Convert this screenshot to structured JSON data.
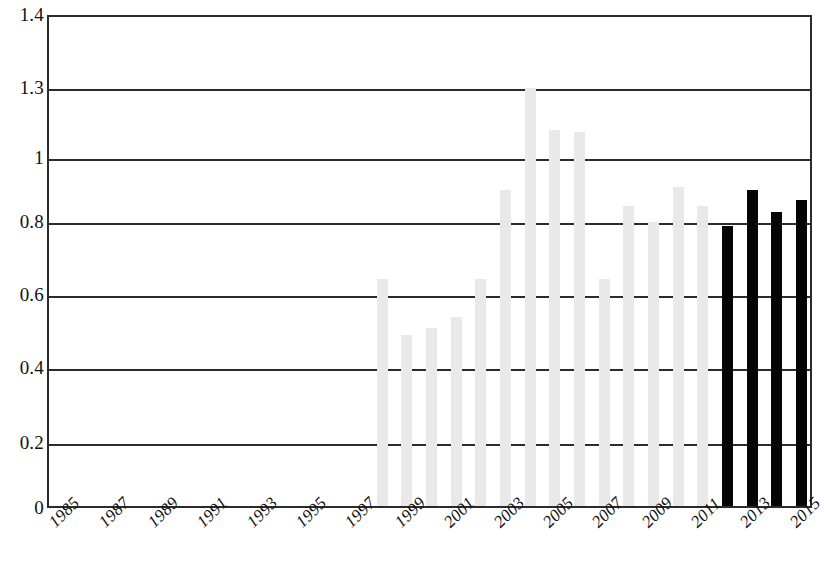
{
  "chart_data": {
    "type": "bar",
    "title": "",
    "subtitle": "",
    "xlabel": "",
    "ylabel": "",
    "grid": true,
    "legend": "none",
    "ylim": [
      0,
      1.4
    ],
    "ytick_labels": [
      "1.4",
      "1.3",
      "1",
      "0.8",
      "0.6",
      "0.4",
      "0.2",
      "0"
    ],
    "ytick_values": [
      1.4,
      1.3,
      1,
      0.8,
      0.6,
      0.4,
      0.2,
      0
    ],
    "xtick_labels": [
      "1985",
      "1987",
      "1989",
      "1991",
      "1993",
      "1995",
      "1997",
      "1999",
      "2001",
      "2003",
      "2005",
      "2007",
      "2009",
      "2011",
      "2013",
      "2015"
    ],
    "categories": [
      "1985",
      "1986",
      "1987",
      "1988",
      "1989",
      "1990",
      "1991",
      "1992",
      "1993",
      "1994",
      "1995",
      "1996",
      "1997",
      "1998",
      "1999",
      "2000",
      "2001",
      "2002",
      "2003",
      "2004",
      "2005",
      "2006",
      "2007",
      "2008",
      "2009",
      "2010",
      "2011",
      "2012",
      "2013",
      "2014",
      "2015"
    ],
    "values": [
      null,
      null,
      null,
      null,
      null,
      null,
      null,
      null,
      null,
      null,
      null,
      null,
      null,
      0.645,
      0.49,
      0.51,
      0.54,
      0.645,
      0.9,
      1.3,
      1.12,
      1.11,
      0.645,
      0.85,
      0.8,
      0.91,
      0.85,
      0.79,
      0.9,
      0.83,
      0.87
    ],
    "series": [
      {
        "name": "historical",
        "color": "#e9e9e9",
        "points": [
          {
            "year": "1998",
            "value": 0.645
          },
          {
            "year": "1999",
            "value": 0.49
          },
          {
            "year": "2000",
            "value": 0.51
          },
          {
            "year": "2001",
            "value": 0.54
          },
          {
            "year": "2002",
            "value": 0.645
          },
          {
            "year": "2003",
            "value": 0.9
          },
          {
            "year": "2004",
            "value": 1.3
          },
          {
            "year": "2005",
            "value": 1.12
          },
          {
            "year": "2006",
            "value": 1.11
          },
          {
            "year": "2007",
            "value": 0.645
          },
          {
            "year": "2008",
            "value": 0.85
          },
          {
            "year": "2009",
            "value": 0.8
          },
          {
            "year": "2010",
            "value": 0.91
          },
          {
            "year": "2011",
            "value": 0.85
          }
        ]
      },
      {
        "name": "recent",
        "color": "#050505",
        "points": [
          {
            "year": "2012",
            "value": 0.79
          },
          {
            "year": "2013",
            "value": 0.9
          },
          {
            "year": "2014",
            "value": 0.83
          },
          {
            "year": "2015",
            "value": 0.87
          }
        ]
      }
    ]
  }
}
